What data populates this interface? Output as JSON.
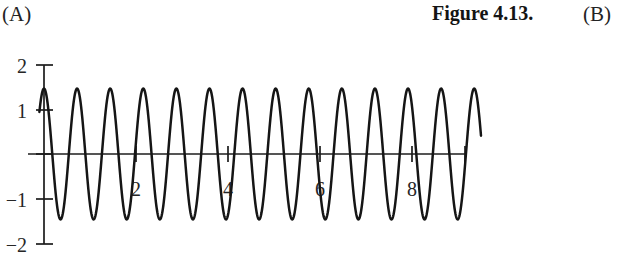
{
  "panel_labels": {
    "left": "(A)",
    "right": "(B)"
  },
  "figure_caption": "Figure 4.13.",
  "colors": {
    "background": "#ffffff",
    "curve": "#151515",
    "axis": "#1c1c1c",
    "text": "#232323"
  },
  "chart_data": {
    "type": "line",
    "title": "",
    "subtitle": "",
    "xlabel": "",
    "ylabel": "",
    "grid": false,
    "legend": null,
    "xlim": [
      -0.35,
      9.55
    ],
    "ylim": [
      -2,
      2
    ],
    "x_ticks": [
      2,
      4,
      6,
      8
    ],
    "x_tick_labels": [
      "2",
      "4",
      "6",
      "8"
    ],
    "y_ticks": [
      -2,
      -1,
      0,
      1,
      2
    ],
    "y_tick_labels": [
      "−2",
      "−1",
      "",
      "1",
      "2"
    ],
    "series": [
      {
        "name": "oscillation",
        "description": "high-frequency cosine oscillation with near-constant amplitude",
        "amplitude": 1.47,
        "frequency_cycles_per_unit": 1.39,
        "phase_deg": 0,
        "x_start": -0.1,
        "x_end": 9.5,
        "n_visible_peaks": 13,
        "peak_value": 1.47,
        "trough_value": -1.45,
        "x": [
          0.0,
          0.36,
          0.72,
          1.08,
          1.44,
          1.8,
          2.16,
          2.52,
          2.88,
          3.24,
          3.6,
          3.96,
          4.32,
          4.68,
          5.04,
          5.4,
          5.76,
          6.12,
          6.48,
          6.84,
          7.2,
          7.56,
          7.92,
          8.28,
          8.64,
          9.0,
          9.36
        ],
        "y": [
          1.47,
          -1.45,
          1.47,
          -1.45,
          1.47,
          -1.45,
          1.47,
          -1.45,
          1.47,
          -1.45,
          1.47,
          -1.45,
          1.47,
          -1.45,
          1.47,
          -1.45,
          1.47,
          -1.45,
          1.47,
          -1.45,
          1.47,
          -1.45,
          1.47,
          -1.45,
          1.47,
          -1.45,
          1.47
        ]
      }
    ]
  }
}
